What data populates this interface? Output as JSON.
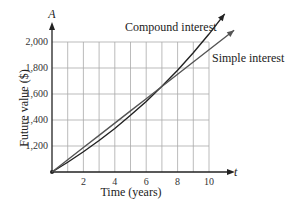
{
  "chart_data": {
    "type": "line",
    "title": "",
    "xlabel": "Time (years)",
    "ylabel": "Future value ($)",
    "x_axis_var": "t",
    "y_axis_var": "A",
    "xlim": [
      0,
      10
    ],
    "ylim": [
      1000,
      2000
    ],
    "x_ticks": [
      "2",
      "4",
      "6",
      "8",
      "10"
    ],
    "y_ticks": [
      "1,200",
      "1,400",
      "1,600",
      "1,800",
      "2,000"
    ],
    "grid": true,
    "series": [
      {
        "name": "Compound interest",
        "x": [
          0,
          1,
          2,
          3,
          4,
          5,
          6,
          7,
          8,
          9,
          10,
          11
        ],
        "values": [
          1000,
          1075,
          1156,
          1242,
          1335,
          1436,
          1543,
          1659,
          1783,
          1917,
          2061,
          2216
        ]
      },
      {
        "name": "Simple interest",
        "x": [
          0,
          1,
          2,
          3,
          4,
          5,
          6,
          7,
          8,
          9,
          10,
          11.6
        ],
        "values": [
          1000,
          1094,
          1188,
          1282,
          1376,
          1470,
          1564,
          1658,
          1752,
          1846,
          1940,
          2090
        ]
      }
    ],
    "annotations": [
      "Compound interest",
      "Simple interest"
    ]
  }
}
